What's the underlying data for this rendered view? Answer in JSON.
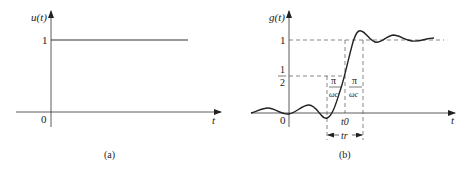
{
  "panel_a": {
    "ylabel": "u(t)",
    "xlabel": "t",
    "origin_label": "0",
    "level_label": "1",
    "caption": "(a)"
  },
  "panel_b": {
    "ylabel": "g(t)",
    "xlabel": "t",
    "origin_label": "0",
    "level_one_label": "1",
    "half_num": "1",
    "half_den": "2",
    "pi_left_num": "π",
    "pi_left_den": "ωc",
    "pi_right_num": "π",
    "pi_right_den": "ωc",
    "t0_label": "t0",
    "tr_label": "tr",
    "caption": "(b)"
  },
  "colors": {
    "ink": "#222222",
    "dash": "#555555"
  }
}
